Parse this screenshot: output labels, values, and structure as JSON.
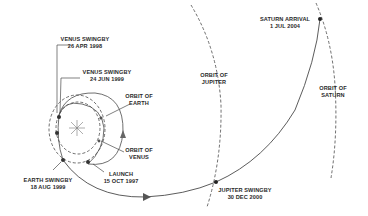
{
  "colors": {
    "line": "#4a4a4a",
    "text": "#2a2a2a",
    "background": "#ffffff"
  },
  "orbits": {
    "earth": {
      "line1": "ORBIT OF",
      "line2": "EARTH"
    },
    "venus": {
      "line1": "ORBIT OF",
      "line2": "VENUS"
    },
    "jupiter": {
      "line1": "ORBIT OF",
      "line2": "JUPITER"
    },
    "saturn": {
      "line1": "ORBIT OF",
      "line2": "SATURN"
    }
  },
  "events": {
    "venus_swingby_1": {
      "name": "VENUS SWINGBY",
      "date": "26 APR 1998"
    },
    "venus_swingby_2": {
      "name": "VENUS SWINGBY",
      "date": "24 JUN 1999"
    },
    "launch": {
      "name": "LAUNCH",
      "date": "15 OCT 1997"
    },
    "earth_swingby": {
      "name": "EARTH SWINGBY",
      "date": "18 AUG 1999"
    },
    "jupiter_swingby": {
      "name": "JUPITER SWINGBY",
      "date": "30 DEC 2000"
    },
    "saturn_arrival": {
      "name": "SATURN ARRIVAL",
      "date": "1 JUL 2004"
    }
  },
  "sun": {
    "icon": "sun-icon"
  }
}
